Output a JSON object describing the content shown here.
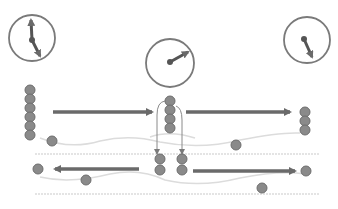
{
  "diagram": {
    "colors": {
      "ball_fill": "#8a8a8a",
      "ball_stroke": "#6e6e6e",
      "arrow": "#6a6a6a",
      "clock_ring": "#7a7a7a",
      "clock_hand": "#555555",
      "guide_line": "#d8d8d8"
    },
    "clocks": [
      {
        "id": "clock-left",
        "cx": 32,
        "cy": 38,
        "r": 23,
        "hands": "up-and-down"
      },
      {
        "id": "clock-center",
        "cx": 170,
        "cy": 63,
        "r": 24,
        "hands": "pointing-upper-right"
      },
      {
        "id": "clock-right",
        "cx": 307,
        "cy": 40,
        "r": 23,
        "hands": "pointing-down"
      }
    ],
    "stacks": [
      {
        "id": "stack-left",
        "x": 30,
        "y_top": 90,
        "count": 6
      },
      {
        "id": "stack-center",
        "x": 170,
        "y_top": 101,
        "count": 4
      },
      {
        "id": "stack-right",
        "x": 305,
        "y_top": 111,
        "count": 3
      },
      {
        "id": "stack-lower-a",
        "x": 160,
        "y_top": 159,
        "count": 2
      },
      {
        "id": "stack-lower-b",
        "x": 182,
        "y_top": 159,
        "count": 2
      }
    ],
    "loose_balls": [
      {
        "x": 52,
        "y": 141
      },
      {
        "x": 236,
        "y": 146
      },
      {
        "x": 38,
        "y": 169
      },
      {
        "x": 86,
        "y": 180
      },
      {
        "x": 306,
        "y": 171
      },
      {
        "x": 262,
        "y": 188
      },
      {
        "x": 236,
        "y": 145
      }
    ],
    "arrows": [
      {
        "id": "arrow-top-left",
        "from": [
          53,
          112
        ],
        "to": [
          156,
          112
        ],
        "direction": "right"
      },
      {
        "id": "arrow-top-right",
        "from": [
          186,
          112
        ],
        "to": [
          294,
          112
        ],
        "direction": "right"
      },
      {
        "id": "arrow-bottom-left",
        "from": [
          139,
          169
        ],
        "to": [
          51,
          169
        ],
        "direction": "left"
      },
      {
        "id": "arrow-bottom-right",
        "from": [
          193,
          171
        ],
        "to": [
          299,
          171
        ],
        "direction": "right"
      }
    ]
  }
}
